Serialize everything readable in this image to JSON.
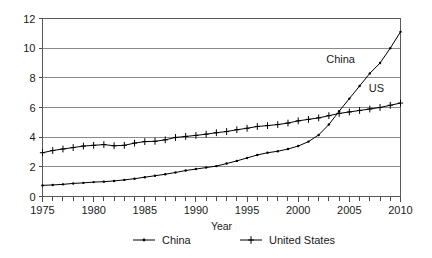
{
  "chart_data": {
    "type": "line",
    "title": "",
    "xlabel": "Year",
    "ylabel": "",
    "xlim": [
      1975,
      2010
    ],
    "ylim": [
      0,
      12
    ],
    "xticks": [
      1975,
      1980,
      1985,
      1990,
      1995,
      2000,
      2005,
      2010
    ],
    "xtick_labels": [
      "1975",
      "1980",
      "1985",
      "1990",
      "1995",
      "2000",
      "2005",
      "2010"
    ],
    "xtick_interval_minor": 1,
    "yticks": [
      0,
      2,
      4,
      6,
      8,
      10,
      12
    ],
    "ytick_labels": [
      "0",
      "2",
      "4",
      "6",
      "8",
      "10",
      "12"
    ],
    "grid": "horizontal",
    "legend_position": "bottom",
    "x": [
      1975,
      1976,
      1977,
      1978,
      1979,
      1980,
      1981,
      1982,
      1983,
      1984,
      1985,
      1986,
      1987,
      1988,
      1989,
      1990,
      1991,
      1992,
      1993,
      1994,
      1995,
      1996,
      1997,
      1998,
      1999,
      2000,
      2001,
      2002,
      2003,
      2004,
      2005,
      2006,
      2007,
      2008,
      2009,
      2010
    ],
    "series": [
      {
        "name": "China",
        "annotation": "China",
        "marker": "dot",
        "values": [
          0.75,
          0.78,
          0.82,
          0.88,
          0.92,
          0.97,
          1.0,
          1.05,
          1.12,
          1.2,
          1.3,
          1.4,
          1.5,
          1.62,
          1.75,
          1.85,
          1.95,
          2.05,
          2.22,
          2.4,
          2.6,
          2.8,
          2.95,
          3.05,
          3.2,
          3.4,
          3.7,
          4.15,
          4.85,
          5.75,
          6.6,
          7.45,
          8.3,
          9.0,
          10.0,
          11.1
        ]
      },
      {
        "name": "United States",
        "annotation": "US",
        "marker": "plus",
        "values": [
          2.95,
          3.1,
          3.2,
          3.3,
          3.4,
          3.45,
          3.5,
          3.42,
          3.45,
          3.6,
          3.7,
          3.72,
          3.82,
          3.98,
          4.05,
          4.12,
          4.2,
          4.3,
          4.38,
          4.5,
          4.6,
          4.72,
          4.78,
          4.85,
          4.95,
          5.1,
          5.2,
          5.3,
          5.45,
          5.6,
          5.7,
          5.8,
          5.9,
          6.0,
          6.15,
          6.3
        ]
      }
    ],
    "legend": [
      {
        "label": "China",
        "marker": "dot"
      },
      {
        "label": "United States",
        "marker": "plus"
      }
    ],
    "colors": {
      "line": "#000000",
      "gridline": "#8a8a8a",
      "frame": "#5a5a5a",
      "text": "#1a1a1a",
      "background": "#ffffff"
    }
  }
}
